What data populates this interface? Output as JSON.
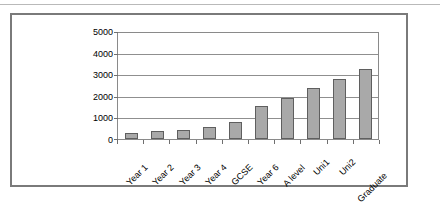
{
  "chart_data": {
    "type": "bar",
    "title": "",
    "subtitle": "",
    "xlabel": "",
    "ylabel": "",
    "categories": [
      "Year 1",
      "Year 2",
      "Year 3",
      "Year 4",
      "GCSE",
      "Year 6",
      "A level",
      "Uni1",
      "Uni2",
      "Graduate"
    ],
    "values": [
      270,
      380,
      420,
      570,
      810,
      1510,
      1900,
      2350,
      2790,
      3250
    ],
    "series": [
      {
        "name": "Vocabulary size",
        "values": [
          270,
          380,
          420,
          570,
          810,
          1510,
          1900,
          2350,
          2790,
          3250
        ]
      }
    ],
    "ylim": [
      0,
      5000
    ],
    "yticks": [
      0,
      1000,
      2000,
      3000,
      4000,
      5000
    ],
    "ytick_labels": [
      "0",
      "1000",
      "2000",
      "3000",
      "4000",
      "5000"
    ],
    "grid": true,
    "grid_axis": "y",
    "legend": false,
    "legend_position": "none",
    "bar_fill_color": "#a9a9a9",
    "bar_border_color": "#5f5f5f",
    "gridline_color": "#8f8f8f",
    "axis_color": "#8a8a8a",
    "frame_border_color": "#7a7a7a",
    "background_color": "#ffffff",
    "xtick_label_rotation": -45
  }
}
